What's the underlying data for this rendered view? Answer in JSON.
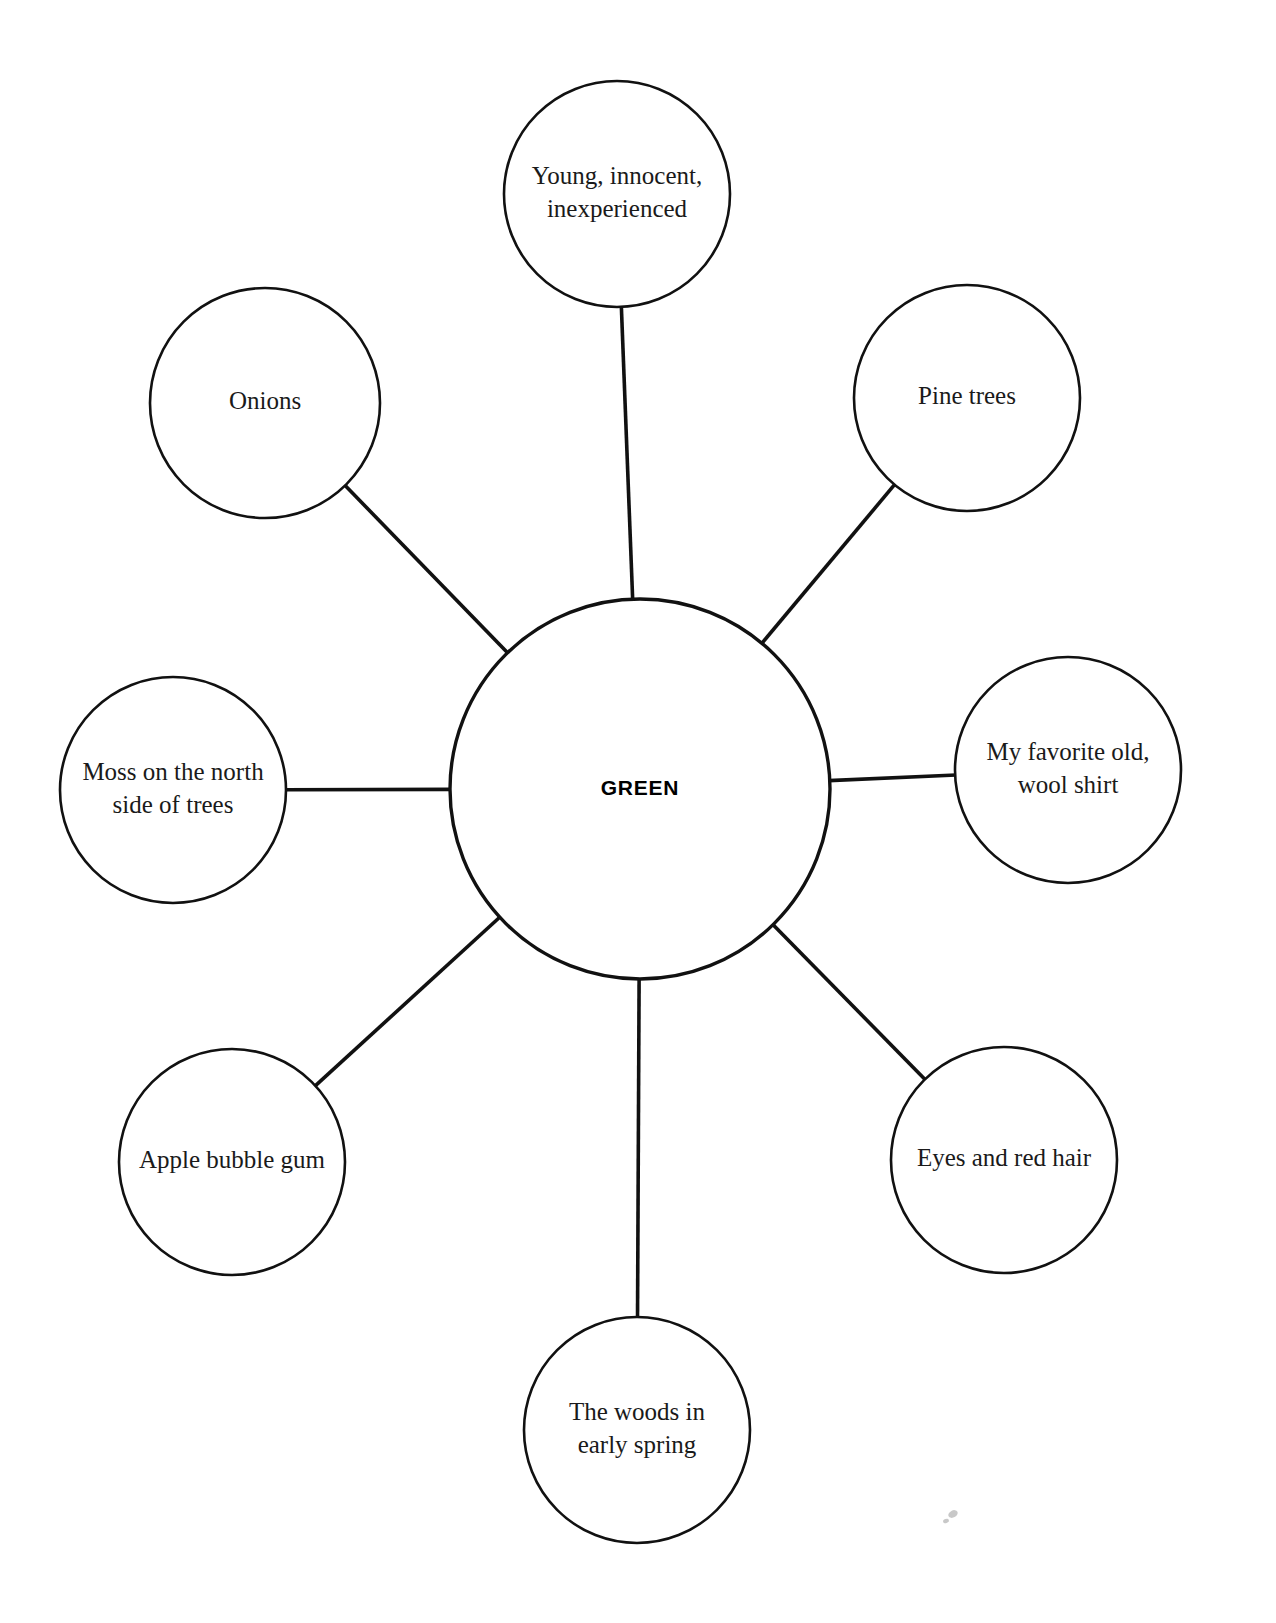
{
  "diagram": {
    "type": "word-web",
    "title": "",
    "background_color": "#ffffff",
    "stroke_color": "#111111",
    "center": {
      "label": "GREEN",
      "cx": 640,
      "cy": 789,
      "r": 190,
      "font_style": "bold-sans"
    },
    "nodes": [
      {
        "id": "north",
        "label": "Young, innocent, inexperienced",
        "lines": [
          "Young, innocent,",
          "inexperienced"
        ],
        "cx": 617,
        "cy": 194,
        "r": 113,
        "angle_deg": 90
      },
      {
        "id": "northwest",
        "label": "Onions",
        "lines": [
          "Onions"
        ],
        "cx": 265,
        "cy": 403,
        "r": 115,
        "angle_deg": 135
      },
      {
        "id": "northeast",
        "label": "Pine trees",
        "lines": [
          "Pine trees"
        ],
        "cx": 967,
        "cy": 398,
        "r": 113,
        "angle_deg": 45
      },
      {
        "id": "west",
        "label": "Moss on the north side of trees",
        "lines": [
          "Moss on the north",
          "side of trees"
        ],
        "cx": 173,
        "cy": 790,
        "r": 113,
        "angle_deg": 180
      },
      {
        "id": "east",
        "label": "My favorite old, wool shirt",
        "lines": [
          "My favorite old,",
          "wool shirt"
        ],
        "cx": 1068,
        "cy": 770,
        "r": 113,
        "angle_deg": 0
      },
      {
        "id": "southwest",
        "label": "Apple bubble gum",
        "lines": [
          "Apple bubble gum"
        ],
        "cx": 232,
        "cy": 1162,
        "r": 113,
        "angle_deg": 225
      },
      {
        "id": "southeast",
        "label": "Eyes and red hair",
        "lines": [
          "Eyes and red hair"
        ],
        "cx": 1004,
        "cy": 1160,
        "r": 113,
        "angle_deg": 315
      },
      {
        "id": "south",
        "label": "The woods in early spring",
        "lines": [
          "The woods in",
          "early spring"
        ],
        "cx": 637,
        "cy": 1430,
        "r": 113,
        "angle_deg": 270
      }
    ]
  }
}
